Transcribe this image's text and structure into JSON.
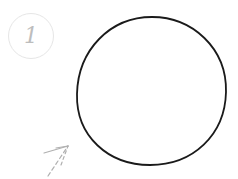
{
  "step": {
    "number": "1"
  },
  "drawing": {
    "shape": "circle",
    "stroke_color": "#1a1a1a",
    "arrow_color": "#b0b0b0"
  }
}
